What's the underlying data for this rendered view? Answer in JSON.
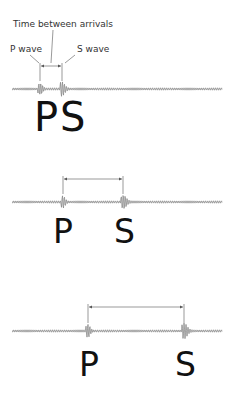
{
  "labels": {
    "time_between": "Time between arrivals",
    "p_wave": "P wave",
    "s_wave": "S wave"
  },
  "panels": [
    {
      "p_letter": "P",
      "s_letter": "S",
      "wave_y": 89,
      "p_x": 40,
      "s_x": 62,
      "bracket_y": 66
    },
    {
      "p_letter": "P",
      "s_letter": "S",
      "wave_y": 202,
      "p_x": 63,
      "s_x": 123,
      "bracket_y": 179
    },
    {
      "p_letter": "P",
      "s_letter": "S",
      "wave_y": 331,
      "p_x": 88,
      "s_x": 184,
      "bracket_y": 307
    }
  ],
  "colors": {
    "wave": "#888888",
    "line": "#555555",
    "text": "#111111"
  }
}
